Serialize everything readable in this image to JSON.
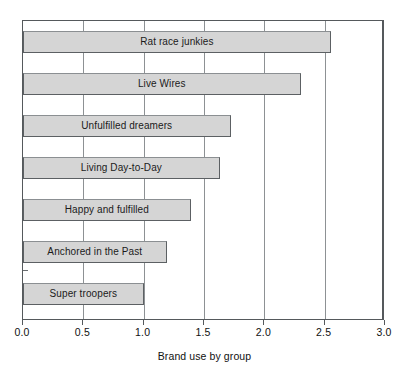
{
  "chart_data": {
    "type": "bar",
    "orientation": "horizontal",
    "title": "",
    "xlabel": "Brand use by group",
    "ylabel": "",
    "categories": [
      "Rat race junkies",
      "Live Wires",
      "Unfulfilled dreamers",
      "Living Day-to-Day",
      "Happy and fulfilled",
      "Anchored in the Past",
      "Super troopers"
    ],
    "values": [
      2.55,
      2.3,
      1.72,
      1.63,
      1.39,
      1.19,
      1.0
    ],
    "xlim": [
      0.0,
      3.0
    ],
    "xticks": [
      0.0,
      0.5,
      1.0,
      1.5,
      2.0,
      2.5,
      3.0
    ],
    "xtick_labels": [
      "0.0",
      "0.5",
      "1.0",
      "1.5",
      "2.0",
      "2.5",
      "3.0"
    ],
    "grid": "vertical",
    "legend": "none",
    "bar_fill_color": "#d5d5d5",
    "bar_edge_color": "#5c6063",
    "axis_color": "#55595c",
    "gridline_color": "#8d9194",
    "label_placement": "inside-bar"
  }
}
